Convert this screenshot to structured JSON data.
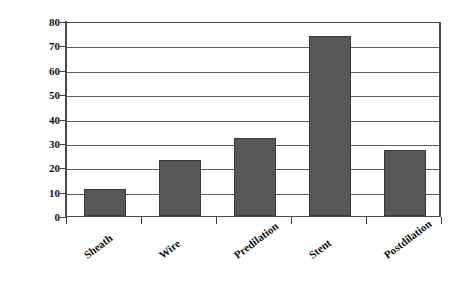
{
  "chart_data": {
    "type": "bar",
    "title": "",
    "xlabel": "",
    "ylabel": "Mean Embolic Count",
    "categories": [
      "Sheath",
      "Wire",
      "Predilation",
      "Stent",
      "Postdilation"
    ],
    "values": [
      11,
      23,
      32,
      74,
      27
    ],
    "ylim": [
      0,
      80
    ],
    "yticks": [
      0,
      10,
      20,
      30,
      40,
      50,
      60,
      70,
      80
    ],
    "ytick_labels": [
      "0",
      "10",
      "20",
      "30",
      "40",
      "50",
      "60",
      "70",
      "80"
    ],
    "grid": true,
    "legend": false,
    "legend_position": "none",
    "series": [
      {
        "name": "Mean Embolic Count",
        "values": [
          11,
          23,
          32,
          74,
          27
        ],
        "color": "#575757"
      }
    ]
  },
  "style": {
    "bar_fill": "#575757",
    "bar_border": "#3a3a3a",
    "gridline_color": "#5c5c5c",
    "axis_color": "#4a4a4a",
    "background": "#ffffff",
    "text_color": "#111111",
    "x_label_rotation_deg": -37
  }
}
